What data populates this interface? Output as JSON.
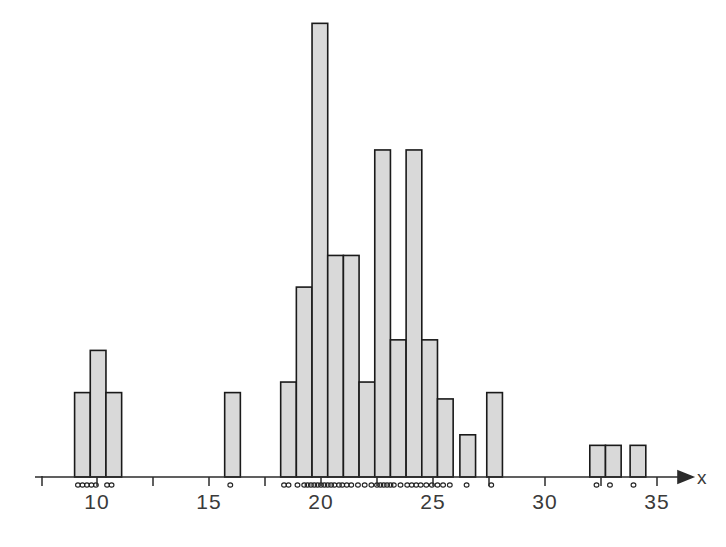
{
  "chart_data": {
    "type": "bar",
    "title": "",
    "subtitle": "",
    "xlabel": "x",
    "ylabel": "",
    "grid": false,
    "legend": null,
    "annotations": [],
    "xlim": [
      8.0,
      36.0
    ],
    "ylim": [
      0,
      22
    ],
    "xticks": [
      10,
      15,
      20,
      25,
      30,
      35
    ],
    "xtick_labels": [
      "10",
      "15",
      "20",
      "25",
      "30",
      "35"
    ],
    "minor_xticks": [
      10,
      12.5,
      15,
      17.5,
      20,
      22.5,
      25,
      27.5,
      30,
      32.5,
      35
    ],
    "bin_width": 0.7,
    "bars": [
      {
        "x0": 9.0,
        "x1": 9.7,
        "height": 4.0
      },
      {
        "x0": 9.7,
        "x1": 10.4,
        "height": 6.0
      },
      {
        "x0": 10.4,
        "x1": 11.1,
        "height": 4.0
      },
      {
        "x0": 15.7,
        "x1": 16.4,
        "height": 4.0
      },
      {
        "x0": 18.2,
        "x1": 18.9,
        "height": 4.5
      },
      {
        "x0": 18.9,
        "x1": 19.6,
        "height": 9.0
      },
      {
        "x0": 19.6,
        "x1": 20.3,
        "height": 21.5
      },
      {
        "x0": 20.3,
        "x1": 21.0,
        "height": 10.5
      },
      {
        "x0": 21.0,
        "x1": 21.7,
        "height": 10.5
      },
      {
        "x0": 21.7,
        "x1": 22.4,
        "height": 4.5
      },
      {
        "x0": 22.4,
        "x1": 23.1,
        "height": 15.5
      },
      {
        "x0": 23.1,
        "x1": 23.8,
        "height": 6.5
      },
      {
        "x0": 23.8,
        "x1": 24.5,
        "height": 15.5
      },
      {
        "x0": 24.5,
        "x1": 25.2,
        "height": 6.5
      },
      {
        "x0": 25.2,
        "x1": 25.9,
        "height": 3.7
      },
      {
        "x0": 26.2,
        "x1": 26.9,
        "height": 2.0
      },
      {
        "x0": 27.4,
        "x1": 28.1,
        "height": 4.0
      },
      {
        "x0": 32.0,
        "x1": 32.7,
        "height": 1.5
      },
      {
        "x0": 32.7,
        "x1": 33.4,
        "height": 1.5
      },
      {
        "x0": 33.8,
        "x1": 34.5,
        "height": 1.5
      }
    ],
    "rug_values": [
      9.15,
      9.35,
      9.55,
      9.75,
      9.95,
      10.45,
      10.65,
      15.95,
      18.35,
      18.55,
      18.95,
      19.25,
      19.4,
      19.55,
      19.7,
      19.85,
      20.0,
      20.15,
      20.3,
      20.45,
      20.6,
      20.8,
      20.95,
      21.15,
      21.35,
      21.65,
      21.95,
      22.25,
      22.5,
      22.65,
      22.8,
      22.95,
      23.1,
      23.25,
      23.55,
      23.85,
      24.05,
      24.25,
      24.45,
      24.7,
      24.95,
      25.2,
      25.45,
      25.75,
      26.5,
      27.6,
      32.3,
      32.9,
      33.95
    ]
  },
  "axis": {
    "x_label": "x",
    "tick_labels": [
      "10",
      "15",
      "20",
      "25",
      "30",
      "35"
    ]
  },
  "colors": {
    "bar_fill": "#d9d9d9",
    "bar_stroke": "#1a1a1a",
    "axis": "#2b2b2b",
    "text": "#3a3a3a",
    "background": "#ffffff"
  }
}
